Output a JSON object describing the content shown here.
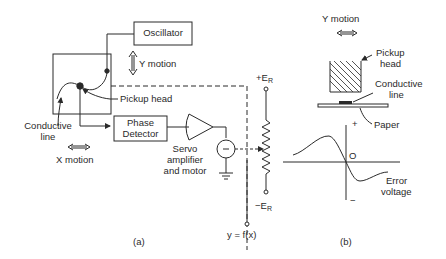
{
  "figure": {
    "panel_a": {
      "caption": "(a)",
      "oscillator_label": "Oscillator",
      "y_motion_label": "Y motion",
      "pickup_head_label": "Pickup head",
      "conductive_line_label_1": "Conductive",
      "conductive_line_label_2": "line",
      "x_motion_label": "X motion",
      "phase_detector_label_1": "Phase",
      "phase_detector_label_2": "Detector",
      "servo_label_1": "Servo",
      "servo_label_2": "amplifier",
      "servo_label_3": "and motor",
      "plus_er_label": "+E",
      "minus_er_label": "−E",
      "er_subscript": "R",
      "output_label": "y = f(x)"
    },
    "panel_b": {
      "caption": "(b)",
      "y_motion_label": "Y motion",
      "pickup_head_label_1": "Pickup",
      "pickup_head_label_2": "head",
      "conductive_line_label_1": "Conductive",
      "conductive_line_label_2": "line",
      "paper_label": "Paper",
      "plus_label": "+",
      "minus_label": "−",
      "origin_label": "O",
      "error_voltage_label_1": "Error",
      "error_voltage_label_2": "voltage"
    }
  },
  "colors": {
    "ink": "#2a2a2a",
    "background": "#ffffff"
  }
}
